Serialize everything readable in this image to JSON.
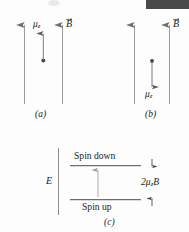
{
  "figure": {
    "caption_letters": {
      "a": "(a)",
      "b": "(b)",
      "c": "(c)"
    },
    "panel_a": {
      "field_label": "B",
      "moment_label_mu": "μ",
      "moment_label_sub": "z",
      "moment_direction": "up",
      "panel_letter": "(a)"
    },
    "panel_b": {
      "field_label": "B",
      "moment_label_mu": "μ",
      "moment_label_sub": "z",
      "moment_direction": "down",
      "panel_letter": "(b)"
    },
    "panel_c": {
      "energy_axis_label": "E",
      "upper_level_label": "Spin down",
      "lower_level_label": "Spin up",
      "splitting_label_prefix": "2",
      "splitting_label_mu": "μ",
      "splitting_label_sub": "z",
      "splitting_label_suffix": "B",
      "panel_letter": "(c)"
    },
    "colors": {
      "ink": "#1b1b1b",
      "line": "#8a8a8a",
      "level_line": "#6f6f6f",
      "background": "#fdfdfd",
      "top_bar": "#4a4a4a"
    }
  }
}
